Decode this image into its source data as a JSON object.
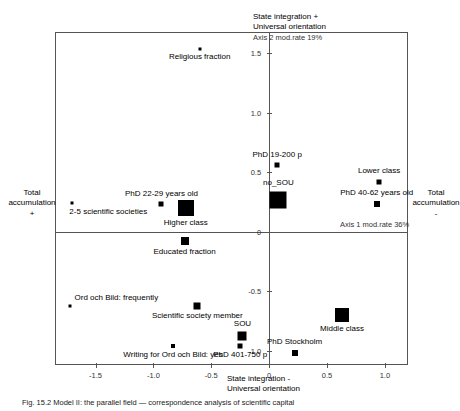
{
  "figure": {
    "caption": "Fig. 15.2  Model II: the parallel field — correspondence analysis of scientific capital"
  },
  "chart_data": {
    "type": "scatter",
    "title": "",
    "xlabel": "State integration -\nUniversal orientation",
    "ylabel": "Total accumulation +",
    "xlim": [
      -1.85,
      1.2
    ],
    "ylim": [
      -1.12,
      1.68
    ],
    "grid": false,
    "legend": "none",
    "axis_annotations": {
      "axis1": "Axis 1 mod.rate 36%",
      "axis2": "Axis 2 mod.rate 19%"
    },
    "pole_labels": {
      "top": "State integration +\nUniversal orientation",
      "top_line1": "State integration +",
      "top_line2": "Universal orientation",
      "bottom_line1": "State integration -",
      "bottom_line2": "Universal orientation",
      "left_line1": "Total",
      "left_line2": "accumulation",
      "left_line3": "+",
      "right_line1": "Total",
      "right_line2": "accumulation",
      "right_line3": "-"
    },
    "xticks": [
      -1.5,
      -1.0,
      -0.5,
      0,
      0.5,
      1.0
    ],
    "xticklabels": [
      "-1.5",
      "-1.0",
      "-0.5",
      "0",
      "0.5",
      "1.0"
    ],
    "yticks": [
      1.5,
      1.0,
      0.5,
      0,
      -0.5,
      -1.0
    ],
    "yticklabels": [
      "1.5",
      "1.0",
      "0.5",
      "0",
      "-0.5",
      "-1.0"
    ],
    "points": [
      {
        "label": "Religious fraction",
        "x": -0.6,
        "y": 1.54,
        "size": 3,
        "label_pos": "below-center"
      },
      {
        "label": "PhD 19-200 p",
        "x": 0.07,
        "y": 0.56,
        "size": 5,
        "label_pos": "above-center"
      },
      {
        "label": "no_SOU",
        "x": 0.08,
        "y": 0.27,
        "size": 17,
        "label_pos": "above-center"
      },
      {
        "label": "Lower class",
        "x": 0.95,
        "y": 0.42,
        "size": 5,
        "label_pos": "above-center"
      },
      {
        "label": "PhD 40-62 years old",
        "x": 0.93,
        "y": 0.23,
        "size": 6,
        "label_pos": "above-center"
      },
      {
        "label": "2-5 scientific societies",
        "x": -1.7,
        "y": 0.24,
        "size": 3,
        "label_pos": "below-left"
      },
      {
        "label": "PhD 22-29 years old",
        "x": -0.93,
        "y": 0.23,
        "size": 5,
        "label_pos": "above-center"
      },
      {
        "label": "Higher class",
        "x": -0.72,
        "y": 0.2,
        "size": 16,
        "label_pos": "below-center"
      },
      {
        "label": "Educated fraction",
        "x": -0.73,
        "y": -0.08,
        "size": 8,
        "label_pos": "below-center"
      },
      {
        "label": "Ord och Bild: frequently",
        "x": -1.72,
        "y": -0.62,
        "size": 3,
        "label_pos": "above-right"
      },
      {
        "label": "Scientific society member",
        "x": -0.62,
        "y": -0.62,
        "size": 7,
        "label_pos": "below-center"
      },
      {
        "label": "Middle class",
        "x": 0.63,
        "y": -0.7,
        "size": 14,
        "label_pos": "below-center"
      },
      {
        "label": "SOU",
        "x": -0.23,
        "y": -0.88,
        "size": 9,
        "label_pos": "above-center"
      },
      {
        "label": "PhD 401-750 p",
        "x": -0.25,
        "y": -0.96,
        "size": 5,
        "label_pos": "below-center"
      },
      {
        "label": "Writing for Ord och Bild: yes",
        "x": -0.83,
        "y": -0.96,
        "size": 4,
        "label_pos": "below-center"
      },
      {
        "label": "PhD Stockholm",
        "x": 0.22,
        "y": -1.02,
        "size": 6,
        "label_pos": "above-center"
      }
    ]
  }
}
